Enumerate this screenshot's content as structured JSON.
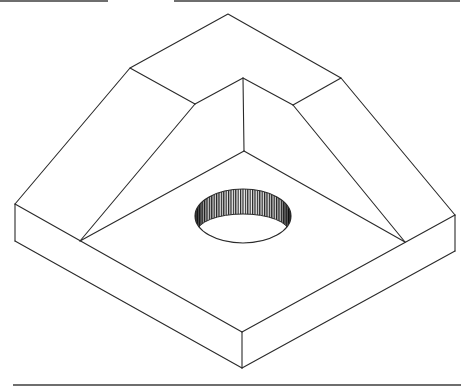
{
  "figure": {
    "type": "isometric-drawing",
    "line_color": "#2a2a2a",
    "rule_color": "#6e6e6e"
  },
  "rules": {
    "top_left": {
      "x1": 0,
      "x2": 108,
      "y": 0
    },
    "top_right": {
      "x1": 174,
      "x2": 460,
      "y": 0
    },
    "bottom": {
      "x1": 13,
      "x2": 461,
      "y": 385
    }
  },
  "hole": {
    "cx": 243,
    "cy": 216,
    "rx": 48,
    "ry": 27
  }
}
